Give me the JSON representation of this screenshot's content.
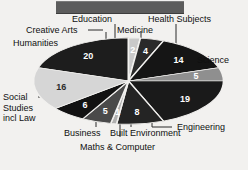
{
  "chart_data": {
    "type": "pie",
    "title": "",
    "xlabel": "",
    "ylabel": "",
    "legend_position": "none",
    "grid": false,
    "total": 100,
    "categories": [
      "Humanities",
      "Creative Arts",
      "Education",
      "Medicine",
      "Health Subjects",
      "Science",
      "Engineering",
      "Built Environment",
      "Maths & Computer",
      "Business",
      "Social Studies incl Law"
    ],
    "values": [
      20,
      2,
      4,
      14,
      5,
      19,
      8,
      1,
      5,
      6,
      16
    ],
    "slices": [
      {
        "label": "Humanities",
        "value": 20,
        "value_text": "20",
        "color": "#1d1d1d",
        "label_color_on_slice": "light"
      },
      {
        "label": "Creative Arts",
        "value": 2,
        "value_text": "2",
        "color": "#c9c9c9",
        "label_color_on_slice": "light"
      },
      {
        "label": "Education",
        "value": 4,
        "value_text": "4",
        "color": "#2a2a2a",
        "label_color_on_slice": "light"
      },
      {
        "label": "Medicine",
        "value": 14,
        "value_text": "14",
        "color": "#151515",
        "label_color_on_slice": "light"
      },
      {
        "label": "Health Subjects",
        "value": 5,
        "value_text": "5",
        "color": "#8f8f8f",
        "label_color_on_slice": "light"
      },
      {
        "label": "Science",
        "value": 19,
        "value_text": "19",
        "color": "#1a1a1a",
        "label_color_on_slice": "light"
      },
      {
        "label": "Engineering",
        "value": 8,
        "value_text": "8",
        "color": "#242424",
        "label_color_on_slice": "light"
      },
      {
        "label": "Built Environment",
        "value": 1,
        "value_text": "1",
        "color": "#b0b0b0",
        "label_color_on_slice": "light"
      },
      {
        "label": "Maths & Computer",
        "value": 5,
        "value_text": "5",
        "color": "#4a4a4a",
        "label_color_on_slice": "light"
      },
      {
        "label": "Business",
        "value": 6,
        "value_text": "6",
        "color": "#121212",
        "label_color_on_slice": "light"
      },
      {
        "label": "Social Studies incl Law",
        "value": 16,
        "value_text": "16",
        "color": "#d6d6d6",
        "label_color_on_slice": "dark"
      }
    ]
  },
  "labels": {
    "education": "Education",
    "health_subjects": "Health Subjects",
    "creative_arts": "Creative Arts",
    "medicine": "Medicine",
    "humanities": "Humanities",
    "science": "Science",
    "social_studies": "Social Studies incl Law",
    "engineering": "Engineering",
    "business": "Business",
    "built_environment": "Built Environment",
    "maths_computer": "Maths & Computer"
  },
  "values": {
    "humanities": "20",
    "creative_arts": "2",
    "education": "4",
    "medicine": "14",
    "health_subjects": "5",
    "science": "19",
    "engineering": "8",
    "built_environment": "1",
    "maths_computer": "5",
    "business": "6",
    "social_studies": "16"
  },
  "colors": {
    "background": "#f2f1ef",
    "topbar": "#5c5c5c",
    "text": "#101010",
    "leader_line": "#2b2b2b"
  }
}
